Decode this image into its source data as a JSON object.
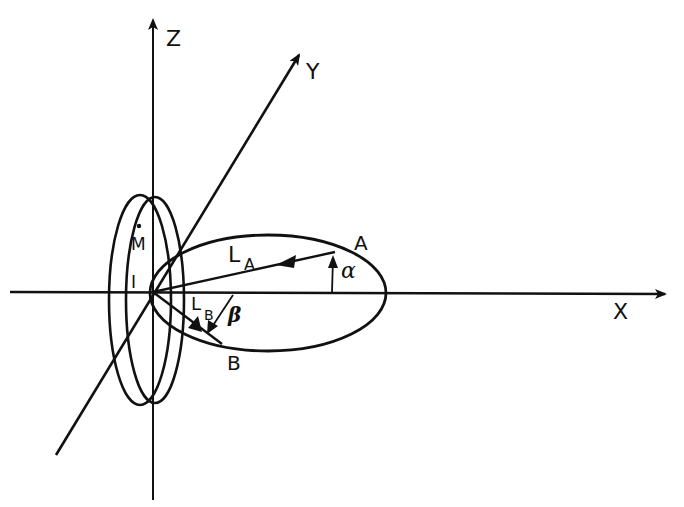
{
  "diagram": {
    "axes": {
      "x": {
        "label": "X"
      },
      "y": {
        "label": "Y"
      },
      "z": {
        "label": "Z"
      }
    },
    "points": {
      "a": {
        "label": "A"
      },
      "b": {
        "label": "B"
      }
    },
    "vectors": {
      "la": {
        "label_main": "L",
        "label_sub": "A"
      },
      "lb": {
        "label_main": "L",
        "label_sub": "B"
      }
    },
    "angles": {
      "alpha": {
        "label": "α"
      },
      "beta": {
        "label": "β"
      }
    },
    "disk": {
      "mdot_label": "M",
      "inertia_label": "I"
    },
    "colors": {
      "ink": "#111111",
      "background": "#ffffff"
    }
  }
}
